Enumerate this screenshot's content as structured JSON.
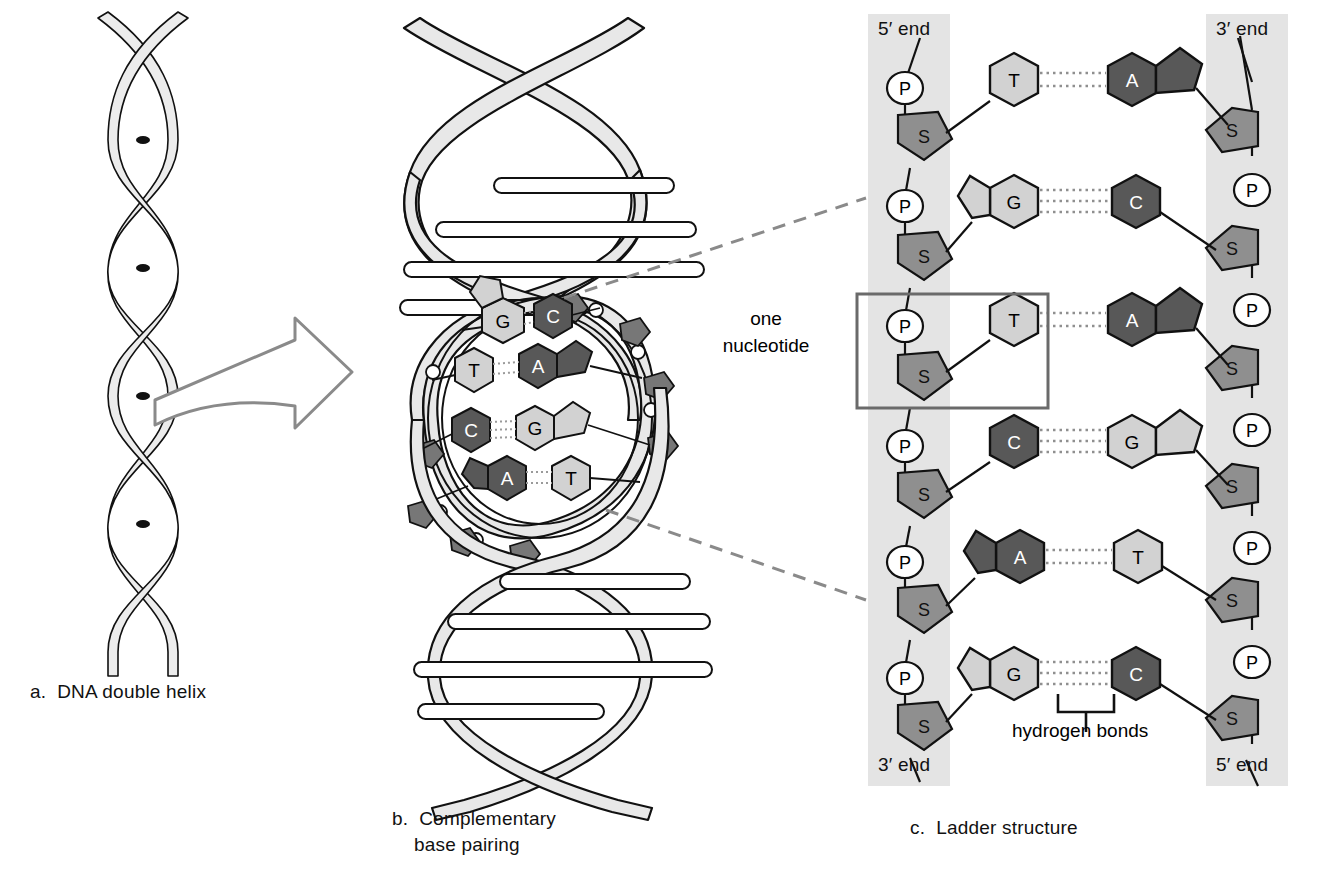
{
  "figure": {
    "panels": [
      {
        "key": "a",
        "caption": "a.  DNA double helix"
      },
      {
        "key": "b",
        "caption": "b.  Complementary\n    base pairing"
      },
      {
        "key": "c",
        "caption": "c.  Ladder structure"
      }
    ]
  },
  "labels": {
    "one_nucleotide": "one\nnucleotide",
    "hydrogen_bonds": "hydrogen bonds",
    "five_prime": "5′ end",
    "three_prime": "3′ end"
  },
  "colors": {
    "backbone_band": "#e2e2e2",
    "sugar_fill": "#8f8f8f",
    "phosphate_fill": "#ffffff",
    "base_light": "#d2d2d2",
    "base_dark": "#585858",
    "ribbon_fill": "#e8e8e8",
    "outline": "#111111",
    "leader_dash": "#8a8a8a",
    "box_stroke": "#6a6a6a"
  },
  "panel_a": {
    "name": "DNA double helix",
    "strands": 2,
    "turns": 4
  },
  "panel_b": {
    "name": "Complementary base pairing",
    "base_pairs_shown": [
      {
        "left": "G",
        "right": "C"
      },
      {
        "left": "T",
        "right": "A"
      },
      {
        "left": "C",
        "right": "G"
      },
      {
        "left": "A",
        "right": "T"
      }
    ]
  },
  "panel_c": {
    "name": "Ladder structure",
    "left_strand": {
      "end_top": "5′ end",
      "end_bottom": "3′ end",
      "units": [
        "P",
        "S",
        "P",
        "S",
        "P",
        "S",
        "P",
        "S",
        "P",
        "S",
        "P",
        "S"
      ]
    },
    "right_strand": {
      "end_top": "3′ end",
      "end_bottom": "5′ end",
      "units": [
        "S",
        "P",
        "S",
        "P",
        "S",
        "P",
        "S",
        "P",
        "S",
        "P",
        "S"
      ]
    },
    "rows": [
      {
        "left_base": "T",
        "left_type": "pyrimidine",
        "left_shade": "light",
        "right_base": "A",
        "right_type": "purine",
        "right_shade": "dark",
        "bonds": 2
      },
      {
        "left_base": "G",
        "left_type": "purine",
        "left_shade": "light",
        "right_base": "C",
        "right_type": "pyrimidine",
        "right_shade": "dark",
        "bonds": 3
      },
      {
        "left_base": "T",
        "left_type": "pyrimidine",
        "left_shade": "light",
        "right_base": "A",
        "right_type": "purine",
        "right_shade": "dark",
        "bonds": 2
      },
      {
        "left_base": "C",
        "left_type": "pyrimidine",
        "left_shade": "dark",
        "right_base": "G",
        "right_type": "purine",
        "right_shade": "light",
        "bonds": 3
      },
      {
        "left_base": "A",
        "left_type": "purine",
        "left_shade": "dark",
        "right_base": "T",
        "right_type": "pyrimidine",
        "right_shade": "light",
        "bonds": 2
      },
      {
        "left_base": "G",
        "left_type": "purine",
        "left_shade": "light",
        "right_base": "C",
        "right_type": "pyrimidine",
        "right_shade": "dark",
        "bonds": 3
      }
    ],
    "highlighted_nucleotide_row": 3,
    "hydrogen_bond_bracket_row": 6
  }
}
